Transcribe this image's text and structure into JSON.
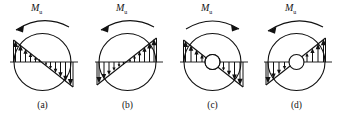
{
  "figure": {
    "name": "circular-section-stress-distribution-figure",
    "width": 339,
    "height": 120,
    "background": "#ffffff",
    "stroke_color": "#111111",
    "panels": [
      {
        "id": "a",
        "caption": "(a)",
        "moment_label_base": "M",
        "moment_label_sub": "u",
        "moment_arrow_direction": "counterclockwise-arrowhead-left",
        "section_type": "solid",
        "neutral_axis_orientation": "inclined-down-right",
        "left_side_arrows": "up",
        "right_side_arrows": "down",
        "arrow_count_left": 6,
        "arrow_count_right": 6
      },
      {
        "id": "b",
        "caption": "(b)",
        "moment_label_base": "M",
        "moment_label_sub": "u",
        "moment_arrow_direction": "counterclockwise-arrowhead-left",
        "section_type": "solid",
        "neutral_axis_orientation": "inclined-up-right",
        "left_side_arrows": "down",
        "right_side_arrows": "up",
        "arrow_count_left": 6,
        "arrow_count_right": 6
      },
      {
        "id": "c",
        "caption": "(c)",
        "moment_label_base": "M",
        "moment_label_sub": "u",
        "moment_arrow_direction": "clockwise-arrowhead-right",
        "section_type": "hollow",
        "neutral_axis_orientation": "inclined-down-right",
        "left_side_arrows": "up",
        "right_side_arrows": "down",
        "arrow_count_left": 4,
        "arrow_count_right": 4
      },
      {
        "id": "d",
        "caption": "(d)",
        "moment_label_base": "M",
        "moment_label_sub": "u",
        "moment_arrow_direction": "counterclockwise-arrowhead-left",
        "section_type": "hollow",
        "neutral_axis_orientation": "inclined-up-right",
        "left_side_arrows": "down",
        "right_side_arrows": "up",
        "arrow_count_left": 4,
        "arrow_count_right": 4
      }
    ]
  }
}
